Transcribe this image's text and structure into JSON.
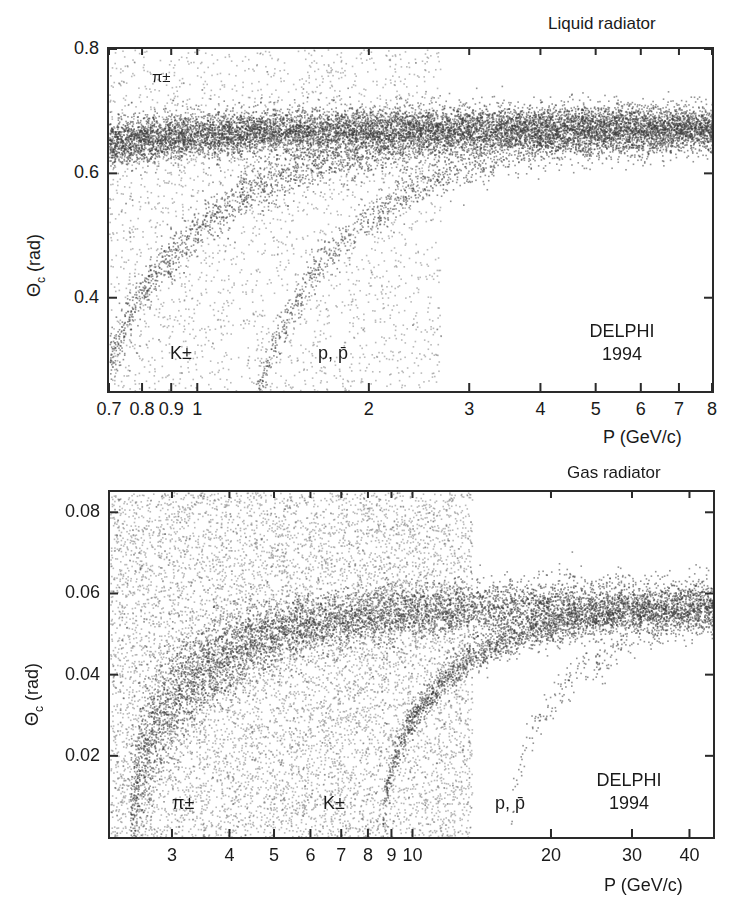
{
  "chart_data": [
    {
      "type": "scatter",
      "title": "Liquid radiator",
      "xlabel": "P (GeV/c)",
      "ylabel": "Θc (rad)",
      "xscale": "log",
      "xlim": [
        0.7,
        8
      ],
      "ylim": [
        0.25,
        0.8
      ],
      "x_ticks": [
        0.7,
        0.8,
        0.9,
        1,
        2,
        3,
        4,
        5,
        6,
        7,
        8
      ],
      "x_tick_labels": [
        "0.7",
        "0.8",
        "0.9",
        "1",
        "2",
        "3",
        "4",
        "5",
        "6",
        "7",
        "8"
      ],
      "y_ticks": [
        0.4,
        0.6,
        0.8
      ],
      "y_tick_labels": [
        "0.4",
        "0.6",
        "0.8"
      ],
      "grid": false,
      "annotations": [
        {
          "text": "π±",
          "x": 0.86,
          "y": 0.765
        },
        {
          "text": "K±",
          "x": 0.86,
          "y": 0.31
        },
        {
          "text": "p, p̄",
          "x": 1.62,
          "y": 0.31
        },
        {
          "text": "DELPHI 1994",
          "x": 5.0,
          "y": 0.32
        }
      ],
      "series": [
        {
          "name": "π±",
          "band": "saturated",
          "theta_max": 0.675,
          "mass": 0.1396,
          "points": 9000,
          "spread": 0.018
        },
        {
          "name": "K±",
          "mass": 0.4937,
          "points": 2600,
          "spread": 0.02
        },
        {
          "name": "p, p̄",
          "mass": 0.9383,
          "points": 1800,
          "spread": 0.016
        },
        {
          "name": "background",
          "points": 2600
        }
      ]
    },
    {
      "type": "scatter",
      "title": "Gas radiator",
      "xlabel": "P (GeV/c)",
      "ylabel": "Θc (rad)",
      "xscale": "log",
      "xlim": [
        2.2,
        45
      ],
      "ylim": [
        0.0,
        0.085
      ],
      "x_ticks": [
        3,
        4,
        5,
        6,
        7,
        8,
        9,
        10,
        20,
        30,
        40
      ],
      "x_tick_labels": [
        "3",
        "4",
        "5",
        "6",
        "7",
        "8",
        "9",
        "10",
        "20",
        "30",
        "40"
      ],
      "y_ticks": [
        0.02,
        0.04,
        0.06,
        0.08
      ],
      "y_tick_labels": [
        "0.02",
        "0.04",
        "0.06",
        "0.08"
      ],
      "grid": false,
      "annotations": [
        {
          "text": "π±",
          "x": 3.3,
          "y": 0.01
        },
        {
          "text": "K±",
          "x": 7.0,
          "y": 0.01
        },
        {
          "text": "p, p̄",
          "x": 17.5,
          "y": 0.01
        },
        {
          "text": "DELPHI 1994",
          "x": 27,
          "y": 0.013
        }
      ],
      "series": [
        {
          "name": "π±",
          "theta_max": 0.0625,
          "mass": 0.1396,
          "points": 7000,
          "spread": 0.0035
        },
        {
          "name": "K±",
          "theta_max": 0.0625,
          "mass": 0.4937,
          "points": 5000,
          "spread": 0.0022
        },
        {
          "name": "p, p̄",
          "theta_max": 0.0625,
          "mass": 0.9383,
          "points": 900,
          "spread": 0.0025
        },
        {
          "name": "background",
          "points": 9000
        }
      ]
    }
  ],
  "panels": {
    "liquid": {
      "title": "Liquid radiator",
      "ylabel": "Θ",
      "ylabel_sub": "c",
      "ylabel_unit": " (rad)",
      "xlabel": "P (GeV/c)",
      "label_pi": "π±",
      "label_k": "K±",
      "label_p": "p, p̄",
      "label_exp": "DELPHI",
      "label_year": "1994"
    },
    "gas": {
      "title": "Gas radiator",
      "ylabel": "Θ",
      "ylabel_sub": "c",
      "ylabel_unit": " (rad)",
      "xlabel": "P (GeV/c)",
      "label_pi": "π±",
      "label_k": "K±",
      "label_p": "p, p̄",
      "label_exp": "DELPHI",
      "label_year": "1994"
    }
  },
  "colors": {
    "ink": "#1a1a1a",
    "frame": "#2a2a2a",
    "dots": "#3a3a3a",
    "background": "#ffffff"
  }
}
